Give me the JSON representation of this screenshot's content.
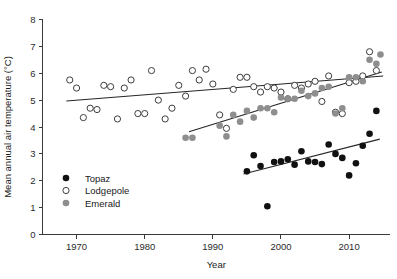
{
  "chart_data": {
    "type": "scatter",
    "title": "",
    "xlabel": "Year",
    "ylabel": "Mean annual air temperature (°C)",
    "xlim": [
      1965,
      2016
    ],
    "ylim": [
      0,
      8
    ],
    "xticks": [
      1970,
      1980,
      1990,
      2000,
      2010
    ],
    "yticks": [
      0,
      1,
      2,
      3,
      4,
      5,
      6,
      7,
      8
    ],
    "grid": false,
    "legend_position": "lower-left-inside",
    "series": [
      {
        "name": "Topaz",
        "marker": "filled-circle",
        "color": "#111111",
        "points": [
          [
            1995,
            2.35
          ],
          [
            1996,
            2.95
          ],
          [
            1997,
            2.55
          ],
          [
            1998,
            1.05
          ],
          [
            1999,
            2.7
          ],
          [
            2000,
            2.72
          ],
          [
            2001,
            2.8
          ],
          [
            2002,
            2.6
          ],
          [
            2003,
            3.1
          ],
          [
            2004,
            2.72
          ],
          [
            2005,
            2.7
          ],
          [
            2006,
            2.62
          ],
          [
            2007,
            3.35
          ],
          [
            2008,
            3.0
          ],
          [
            2009,
            2.85
          ],
          [
            2010,
            2.2
          ],
          [
            2011,
            2.65
          ],
          [
            2012,
            3.3
          ],
          [
            2013,
            3.75
          ],
          [
            2014,
            4.6
          ]
        ],
        "trend": {
          "x0": 1994.5,
          "y0": 2.25,
          "x1": 2014.5,
          "y1": 3.55
        }
      },
      {
        "name": "Lodgepole",
        "marker": "open-circle",
        "color": "#ffffff",
        "points": [
          [
            1969,
            5.75
          ],
          [
            1970,
            5.45
          ],
          [
            1971,
            4.35
          ],
          [
            1972,
            4.7
          ],
          [
            1973,
            4.65
          ],
          [
            1974,
            5.55
          ],
          [
            1975,
            5.5
          ],
          [
            1976,
            4.3
          ],
          [
            1977,
            5.45
          ],
          [
            1978,
            5.75
          ],
          [
            1979,
            4.5
          ],
          [
            1980,
            4.5
          ],
          [
            1981,
            6.1
          ],
          [
            1982,
            5.0
          ],
          [
            1983,
            4.3
          ],
          [
            1984,
            4.7
          ],
          [
            1985,
            5.55
          ],
          [
            1986,
            5.15
          ],
          [
            1987,
            6.1
          ],
          [
            1988,
            5.75
          ],
          [
            1989,
            6.15
          ],
          [
            1990,
            5.6
          ],
          [
            1991,
            4.45
          ],
          [
            1992,
            3.95
          ],
          [
            1993,
            5.4
          ],
          [
            1994,
            5.85
          ],
          [
            1995,
            5.85
          ],
          [
            1996,
            5.5
          ],
          [
            1997,
            5.3
          ],
          [
            1998,
            5.5
          ],
          [
            1999,
            5.45
          ],
          [
            2000,
            5.3
          ],
          [
            2001,
            5.05
          ],
          [
            2002,
            5.55
          ],
          [
            2003,
            5.45
          ],
          [
            2004,
            5.6
          ],
          [
            2005,
            5.7
          ],
          [
            2006,
            4.95
          ],
          [
            2007,
            5.9
          ],
          [
            2008,
            4.55
          ],
          [
            2009,
            4.5
          ],
          [
            2010,
            5.65
          ],
          [
            2011,
            5.7
          ],
          [
            2012,
            5.9
          ],
          [
            2013,
            6.8
          ],
          [
            2014,
            6.1
          ]
        ],
        "trend": {
          "x0": 1968.5,
          "y0": 4.97,
          "x1": 2015.0,
          "y1": 5.9
        }
      },
      {
        "name": "Emerald",
        "marker": "filled-circle",
        "color": "#8e8e8e",
        "points": [
          [
            1986,
            3.6
          ],
          [
            1987,
            3.6
          ],
          [
            1991,
            4.05
          ],
          [
            1992,
            3.65
          ],
          [
            1993,
            4.45
          ],
          [
            1994,
            4.2
          ],
          [
            1995,
            4.6
          ],
          [
            1996,
            4.35
          ],
          [
            1997,
            4.7
          ],
          [
            1998,
            4.7
          ],
          [
            1999,
            4.55
          ],
          [
            2000,
            5.1
          ],
          [
            2001,
            5.05
          ],
          [
            2002,
            5.05
          ],
          [
            2003,
            5.35
          ],
          [
            2004,
            5.15
          ],
          [
            2005,
            5.25
          ],
          [
            2006,
            5.45
          ],
          [
            2007,
            5.5
          ],
          [
            2008,
            4.5
          ],
          [
            2009,
            4.7
          ],
          [
            2010,
            5.85
          ],
          [
            2011,
            5.85
          ],
          [
            2012,
            5.7
          ],
          [
            2013,
            6.5
          ],
          [
            2014,
            6.35
          ],
          [
            2014.6,
            6.7
          ]
        ],
        "trend": {
          "x0": 1986.5,
          "y0": 3.82,
          "x1": 2014.8,
          "y1": 6.05
        }
      }
    ]
  },
  "legend": {
    "entries": [
      {
        "label": "Topaz",
        "marker": "filled-circle",
        "color": "#111111"
      },
      {
        "label": "Lodgepole",
        "marker": "open-circle",
        "color": "#ffffff"
      },
      {
        "label": "Emerald",
        "marker": "filled-circle",
        "color": "#8e8e8e"
      }
    ]
  },
  "axes": {
    "x_title": "Year",
    "y_title": "Mean annual air temperature (°C)",
    "x_tick_labels": [
      "1970",
      "1980",
      "1990",
      "2000",
      "2010"
    ],
    "y_tick_labels": [
      "0",
      "1",
      "2",
      "3",
      "4",
      "5",
      "6",
      "7",
      "8"
    ]
  }
}
